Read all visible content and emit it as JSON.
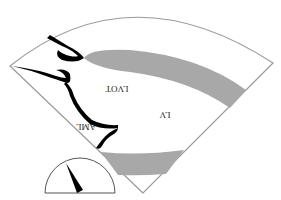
{
  "diagram": {
    "type": "echocardiography-sector-schematic",
    "orientation": "rotated-180",
    "labels": {
      "lv": "LV",
      "lvot": "LVOT",
      "aml": "AML"
    },
    "colors": {
      "background": "#ffffff",
      "sector_outline": "#9a9a9a",
      "myocardium_fill": "#a8a8a8",
      "valve_leaflets": "#000000",
      "gauge_outline": "#555555",
      "needle": "#000000"
    },
    "gauge": {
      "shape": "semicircle",
      "needle_direction": "up-left"
    }
  }
}
